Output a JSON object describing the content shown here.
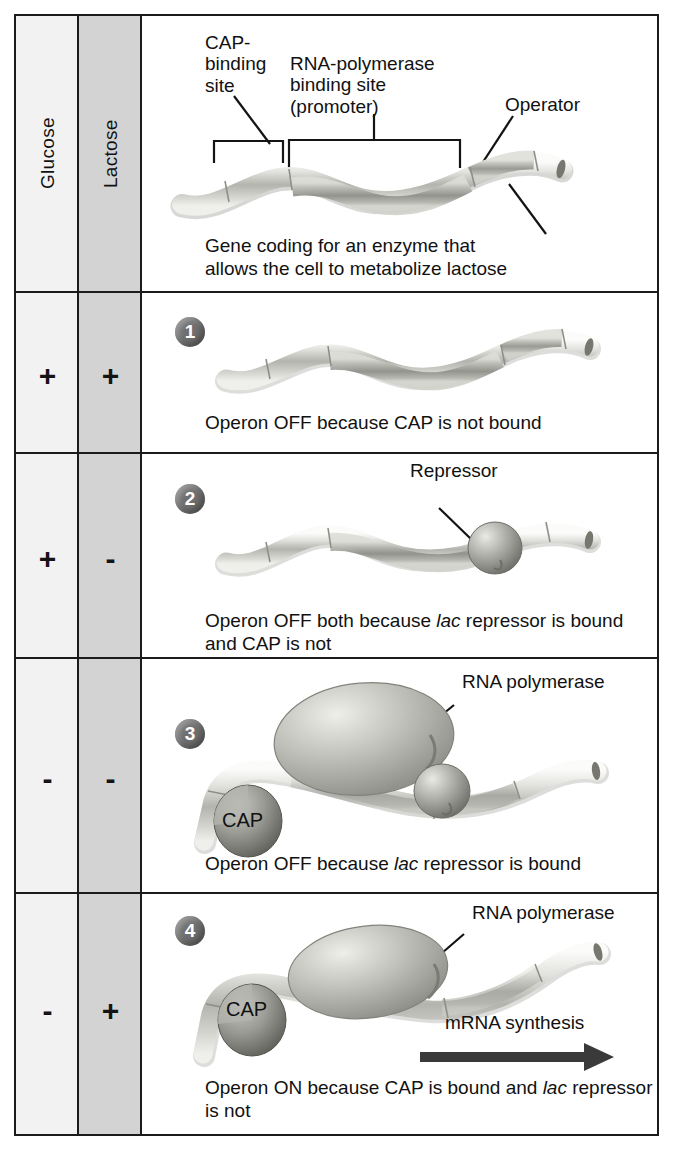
{
  "figure": {
    "columns": [
      {
        "key": "glucose",
        "label": "Glucose",
        "bg": "#f2f2f2"
      },
      {
        "key": "lactose",
        "label": "Lactose",
        "bg": "#d3d3d3"
      }
    ],
    "colors": {
      "border": "#1b1b1b",
      "glucose_column": "#f2f2f2",
      "lactose_column": "#d3d3d3",
      "badge": "#6f6f6f",
      "dna_light": "#d8d8d4",
      "dna_mid": "#a8a8a2",
      "dna_dark": "#8a8a84",
      "protein": "#b9b9b4",
      "arrow": "#3a3a3a",
      "text": "#111111"
    }
  },
  "header_row": {
    "labels": {
      "cap_binding_site": "CAP-\nbinding\nsite",
      "rnap_binding_site": "RNA-polymerase\nbinding site\n(promoter)",
      "operator": "Operator"
    },
    "gene_caption_line1": "Gene coding for an enzyme that",
    "gene_caption_line2": "allows the cell to metabolize lactose"
  },
  "rows": [
    {
      "number": "1",
      "glucose": "+",
      "lactose": "+",
      "caption_html": "Operon OFF because CAP is not bound",
      "elements": [
        "dna"
      ],
      "labels": []
    },
    {
      "number": "2",
      "glucose": "+",
      "lactose": "-",
      "caption_html": "Operon OFF both because <i>lac</i> repressor is bound and CAP is not",
      "elements": [
        "dna",
        "repressor"
      ],
      "labels": [
        {
          "name": "repressor",
          "text": "Repressor"
        }
      ]
    },
    {
      "number": "3",
      "glucose": "-",
      "lactose": "-",
      "caption_html": "Operon OFF because <i>lac</i> repressor is bound",
      "elements": [
        "dna",
        "cap",
        "rna-polymerase",
        "repressor"
      ],
      "labels": [
        {
          "name": "rna-polymerase",
          "text": "RNA polymerase"
        },
        {
          "name": "cap",
          "text": "CAP"
        }
      ]
    },
    {
      "number": "4",
      "glucose": "-",
      "lactose": "+",
      "caption_html": "Operon ON because CAP is bound and <i>lac</i> repressor is not",
      "elements": [
        "dna",
        "cap",
        "rna-polymerase",
        "mrna-arrow"
      ],
      "labels": [
        {
          "name": "rna-polymerase",
          "text": "RNA polymerase"
        },
        {
          "name": "cap",
          "text": "CAP"
        },
        {
          "name": "mrna-synthesis",
          "text": "mRNA synthesis"
        }
      ]
    }
  ]
}
